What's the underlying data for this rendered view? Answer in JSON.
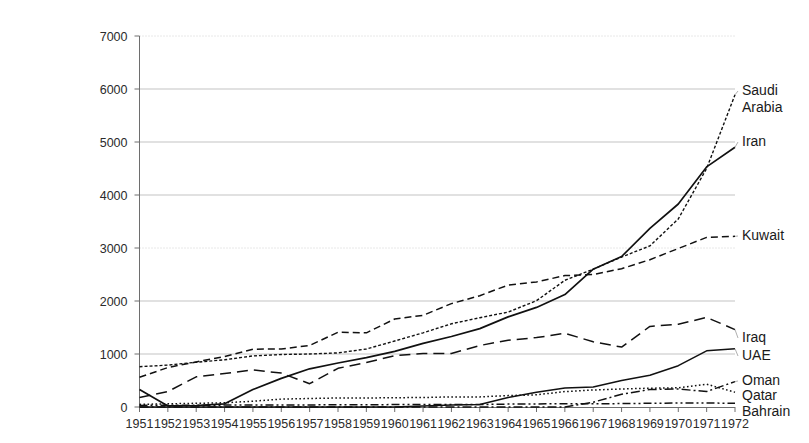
{
  "chart_data": {
    "type": "line",
    "title": "",
    "subtitle": "",
    "xlabel": "",
    "ylabel": "",
    "grid": true,
    "legend_position": "right-of-plot-line-end",
    "xlim": [
      1951,
      1972
    ],
    "ylim": [
      0,
      7000
    ],
    "y_ticks": [
      0,
      1000,
      2000,
      3000,
      4000,
      5000,
      6000,
      7000
    ],
    "categories": [
      1951,
      1952,
      1953,
      1954,
      1955,
      1956,
      1957,
      1958,
      1959,
      1960,
      1961,
      1962,
      1963,
      1964,
      1965,
      1966,
      1967,
      1968,
      1969,
      1970,
      1971,
      1972
    ],
    "x_tick_labels": [
      "1951",
      "1952",
      "1953",
      "1954",
      "1955",
      "1956",
      "1957",
      "1958",
      "1959",
      "1960",
      "1961",
      "1962",
      "1963",
      "1964",
      "1965",
      "1966",
      "1967",
      "1968",
      "1969",
      "1970",
      "1971",
      "1972"
    ],
    "series": [
      {
        "name": "Saudi Arabia",
        "style": "fine-dotted",
        "values": [
          760,
          790,
          845,
          890,
          965,
          990,
          1000,
          1020,
          1095,
          1245,
          1400,
          1570,
          1685,
          1790,
          2005,
          2390,
          2600,
          2830,
          3040,
          3550,
          4500,
          5890
        ]
      },
      {
        "name": "Iran",
        "style": "solid",
        "values": [
          330,
          20,
          28,
          60,
          330,
          540,
          720,
          830,
          930,
          1050,
          1200,
          1330,
          1480,
          1700,
          1880,
          2120,
          2600,
          2840,
          3370,
          3830,
          4530,
          4900
        ]
      },
      {
        "name": "Kuwait",
        "style": "medium-dashed",
        "values": [
          560,
          745,
          850,
          950,
          1090,
          1095,
          1160,
          1410,
          1400,
          1660,
          1730,
          1950,
          2100,
          2300,
          2360,
          2480,
          2500,
          2610,
          2780,
          2990,
          3200,
          3220
        ]
      },
      {
        "name": "Iraq",
        "style": "long-dashed",
        "values": [
          180,
          290,
          570,
          630,
          700,
          640,
          440,
          730,
          840,
          970,
          1010,
          1010,
          1160,
          1260,
          1310,
          1390,
          1230,
          1130,
          1520,
          1560,
          1690,
          1460
        ]
      },
      {
        "name": "UAE",
        "style": "solid-thin",
        "values": [
          0,
          0,
          0,
          0,
          0,
          0,
          0,
          0,
          0,
          0,
          20,
          35,
          50,
          180,
          280,
          360,
          380,
          500,
          600,
          780,
          1060,
          1100
        ]
      },
      {
        "name": "Oman",
        "style": "dash-dot",
        "values": [
          0,
          0,
          0,
          0,
          0,
          0,
          0,
          0,
          0,
          0,
          0,
          0,
          0,
          0,
          0,
          0,
          90,
          240,
          330,
          340,
          290,
          480
        ]
      },
      {
        "name": "Qatar",
        "style": "dotted",
        "values": [
          50,
          60,
          70,
          80,
          110,
          150,
          160,
          170,
          170,
          175,
          180,
          190,
          190,
          215,
          230,
          290,
          320,
          340,
          355,
          363,
          430,
          280
        ]
      },
      {
        "name": "Bahrain",
        "style": "dash-dot-dot",
        "values": [
          30,
          32,
          33,
          35,
          36,
          38,
          40,
          42,
          43,
          45,
          46,
          47,
          48,
          55,
          58,
          60,
          62,
          65,
          70,
          76,
          75,
          70
        ]
      }
    ],
    "legend_labels": [
      "Saudi Arabia",
      "Iran",
      "Kuwait",
      "Iraq",
      "UAE",
      "Oman",
      "Qatar",
      "Bahrain"
    ],
    "colors": {
      "line": "#111111",
      "grid": "#a9a9a9",
      "text": "#1a1a1a",
      "background": "#ffffff"
    }
  }
}
